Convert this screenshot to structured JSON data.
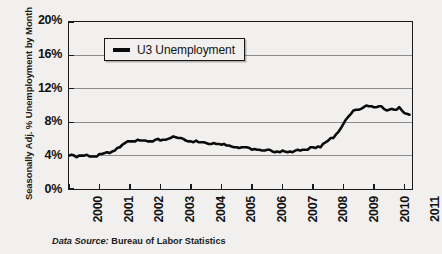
{
  "chart_data": {
    "type": "line",
    "title": "",
    "xlabel": "",
    "ylabel": "Seasonally Adj. % Unemployment by Month",
    "xlim": [
      2000,
      2011.25
    ],
    "ylim": [
      0,
      20
    ],
    "y_ticks": [
      "0%",
      "4%",
      "8%",
      "12%",
      "16%",
      "20%"
    ],
    "y_tick_values": [
      0,
      4,
      8,
      12,
      16,
      20
    ],
    "x_ticks": [
      "2000",
      "2001",
      "2002",
      "2003",
      "2004",
      "2005",
      "2006",
      "2007",
      "2008",
      "2009",
      "2010",
      "2011"
    ],
    "x_tick_values": [
      2000,
      2001,
      2002,
      2003,
      2004,
      2005,
      2006,
      2007,
      2008,
      2009,
      2010,
      2011
    ],
    "grid": "horizontal",
    "legend_position": "top-left-inside",
    "series": [
      {
        "name": "U3 Unemployment",
        "color": "#0b0b0b",
        "x": [
          2000.0,
          2000.08,
          2000.17,
          2000.25,
          2000.33,
          2000.42,
          2000.5,
          2000.58,
          2000.67,
          2000.75,
          2000.83,
          2000.92,
          2001.0,
          2001.08,
          2001.17,
          2001.25,
          2001.33,
          2001.42,
          2001.5,
          2001.58,
          2001.67,
          2001.75,
          2001.83,
          2001.92,
          2002.0,
          2002.08,
          2002.17,
          2002.25,
          2002.33,
          2002.42,
          2002.5,
          2002.58,
          2002.67,
          2002.75,
          2002.83,
          2002.92,
          2003.0,
          2003.08,
          2003.17,
          2003.25,
          2003.33,
          2003.42,
          2003.5,
          2003.58,
          2003.67,
          2003.75,
          2003.83,
          2003.92,
          2004.0,
          2004.08,
          2004.17,
          2004.25,
          2004.33,
          2004.42,
          2004.5,
          2004.58,
          2004.67,
          2004.75,
          2004.83,
          2004.92,
          2005.0,
          2005.08,
          2005.17,
          2005.25,
          2005.33,
          2005.42,
          2005.5,
          2005.58,
          2005.67,
          2005.75,
          2005.83,
          2005.92,
          2006.0,
          2006.08,
          2006.17,
          2006.25,
          2006.33,
          2006.42,
          2006.5,
          2006.58,
          2006.67,
          2006.75,
          2006.83,
          2006.92,
          2007.0,
          2007.08,
          2007.17,
          2007.25,
          2007.33,
          2007.42,
          2007.5,
          2007.58,
          2007.67,
          2007.75,
          2007.83,
          2007.92,
          2008.0,
          2008.08,
          2008.17,
          2008.25,
          2008.33,
          2008.42,
          2008.5,
          2008.58,
          2008.67,
          2008.75,
          2008.83,
          2008.92,
          2009.0,
          2009.08,
          2009.17,
          2009.25,
          2009.33,
          2009.42,
          2009.5,
          2009.58,
          2009.67,
          2009.75,
          2009.83,
          2009.92,
          2010.0,
          2010.08,
          2010.17,
          2010.25,
          2010.33,
          2010.42,
          2010.5,
          2010.58,
          2010.67,
          2010.75,
          2010.83,
          2010.92,
          2011.0,
          2011.08,
          2011.17
        ],
        "values": [
          4.0,
          4.1,
          4.0,
          3.8,
          4.0,
          4.0,
          4.0,
          4.1,
          3.9,
          3.9,
          3.9,
          3.9,
          4.2,
          4.2,
          4.3,
          4.4,
          4.3,
          4.5,
          4.6,
          4.9,
          5.0,
          5.3,
          5.5,
          5.7,
          5.7,
          5.7,
          5.7,
          5.9,
          5.8,
          5.8,
          5.8,
          5.7,
          5.7,
          5.7,
          5.9,
          6.0,
          5.8,
          5.9,
          5.9,
          6.0,
          6.1,
          6.3,
          6.2,
          6.1,
          6.1,
          6.0,
          5.8,
          5.7,
          5.7,
          5.6,
          5.8,
          5.6,
          5.6,
          5.6,
          5.5,
          5.4,
          5.4,
          5.5,
          5.4,
          5.4,
          5.3,
          5.4,
          5.2,
          5.2,
          5.1,
          5.0,
          5.0,
          4.9,
          5.0,
          5.0,
          5.0,
          4.9,
          4.7,
          4.8,
          4.7,
          4.7,
          4.6,
          4.6,
          4.7,
          4.7,
          4.5,
          4.4,
          4.5,
          4.4,
          4.6,
          4.5,
          4.4,
          4.5,
          4.4,
          4.6,
          4.7,
          4.6,
          4.7,
          4.7,
          4.7,
          5.0,
          5.0,
          4.9,
          5.1,
          5.0,
          5.4,
          5.6,
          5.8,
          6.1,
          6.1,
          6.5,
          6.8,
          7.3,
          7.8,
          8.3,
          8.7,
          9.0,
          9.4,
          9.5,
          9.5,
          9.6,
          9.8,
          10.0,
          9.9,
          9.9,
          9.8,
          9.8,
          9.9,
          9.9,
          9.6,
          9.4,
          9.5,
          9.6,
          9.5,
          9.5,
          9.8,
          9.4,
          9.1,
          9.0,
          8.9
        ]
      }
    ],
    "caption_label": "Data Source:",
    "caption_value": "Bureau of Labor Statistics"
  },
  "axis": {
    "y_title": "Seasonally Adj. % Unemployment by Month"
  },
  "legend": {
    "label": "U3 Unemployment"
  },
  "caption": {
    "label": "Data Source:",
    "value": "Bureau of Labor Statistics"
  }
}
